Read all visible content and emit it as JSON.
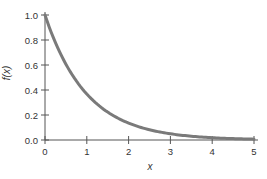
{
  "chart_data": {
    "type": "line",
    "title": "",
    "xlabel": "x",
    "ylabel": "f(x)",
    "xlim": [
      0,
      5
    ],
    "ylim": [
      0,
      1
    ],
    "xticks": [
      "0",
      "1",
      "2",
      "3",
      "4",
      "5"
    ],
    "yticks": [
      "0.0",
      "0.2",
      "0.4",
      "0.6",
      "0.8",
      "1.0"
    ],
    "grid": false,
    "legend": null,
    "series": [
      {
        "name": "f(x) = e^(-x)",
        "color": "#7a7a7a",
        "x": [
          0,
          0.5,
          1,
          1.5,
          2,
          2.5,
          3,
          3.5,
          4,
          4.5,
          5
        ],
        "y": [
          1.0,
          0.61,
          0.37,
          0.22,
          0.14,
          0.08,
          0.05,
          0.03,
          0.02,
          0.01,
          0.01
        ]
      }
    ]
  },
  "colors": {
    "axis": "#555555",
    "curve": "#7a7a7a",
    "text": "#333333"
  }
}
